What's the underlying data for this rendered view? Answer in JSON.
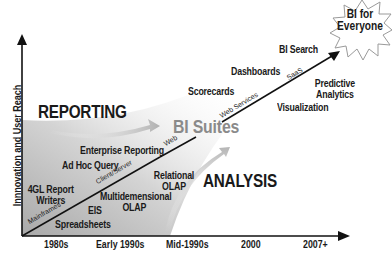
{
  "diagram": {
    "y_axis_label": "Innnovation and User Reach",
    "x_axis_ticks": [
      "1980s",
      "Early 1990s",
      "Mid-1990s",
      "2000",
      "2007+"
    ],
    "regions": {
      "reporting": "REPORTING",
      "analysis": "ANALYSIS",
      "bi_suites": "BI Suites"
    },
    "trend_line_segments": [
      "Mainframes",
      "Client/Server",
      "Web",
      "Web Services",
      "SaaS"
    ],
    "destination": {
      "line1": "BI for",
      "line2": "Everyone"
    },
    "reporting_items": [
      "4GL Report",
      "Writers",
      "Ad Hoc Query",
      "Enterprise Reporting",
      "Scorecards",
      "Dashboards",
      "BI Search"
    ],
    "analysis_items": [
      "Spreadsheets",
      "EIS",
      "Multidemensional",
      "OLAP",
      "Relational",
      "OLAP",
      "Visualization",
      "Predictive",
      "Analytics"
    ],
    "colors": {
      "text": "#1a1a1a",
      "suites": "#8a8a8a",
      "shade_dark": "#bdbdbd",
      "shade_light": "#f2f2f2",
      "line": "#111111"
    }
  }
}
